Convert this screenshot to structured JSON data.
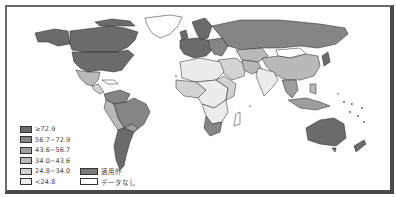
{
  "map": {
    "colors": {
      "c1": "#6b6b6b",
      "c2": "#858585",
      "c3": "#9e9e9e",
      "c4": "#b9b9b9",
      "c5": "#d3d3d3",
      "c6": "#ececec",
      "na": "#7a7a7a",
      "nodata": "#ffffff"
    }
  },
  "legend": {
    "items": [
      {
        "label": "≥72.9",
        "color": "#6b6b6b"
      },
      {
        "label": "56.7−72.9",
        "color": "#858585"
      },
      {
        "label": "43.6−56.7",
        "color": "#9e9e9e"
      },
      {
        "label": "34.0−43.6",
        "color": "#b9b9b9"
      },
      {
        "label": "24.8−34.0",
        "color": "#d3d3d3"
      },
      {
        "label": "<24.8",
        "color": "#ececec"
      }
    ],
    "extra": [
      {
        "label": "適用外",
        "color": "#7a7a7a"
      },
      {
        "label": "データなし",
        "color": "#ffffff"
      }
    ]
  }
}
